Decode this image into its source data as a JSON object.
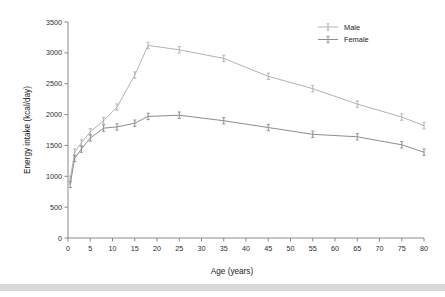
{
  "chart_data": {
    "type": "line",
    "title": "",
    "xlabel": "Age (years)",
    "ylabel": "Energy intake (kcal/day)",
    "xlim": [
      0,
      80
    ],
    "ylim": [
      0,
      3500
    ],
    "xticks": [
      0,
      5,
      10,
      15,
      20,
      25,
      30,
      35,
      40,
      45,
      50,
      55,
      60,
      65,
      70,
      75,
      80
    ],
    "yticks": [
      0,
      500,
      1000,
      1500,
      2000,
      2500,
      3000,
      3500
    ],
    "grid": false,
    "legend_position": "top-right",
    "x": [
      0.5,
      1.5,
      3,
      5,
      8,
      11,
      15,
      18,
      25,
      35,
      45,
      55,
      65,
      75,
      80
    ],
    "series": [
      {
        "name": "Male",
        "color": "#b3b3b3",
        "marker": "error-bar",
        "values": [
          950,
          1390,
          1540,
          1720,
          1900,
          2120,
          2640,
          3120,
          3050,
          2910,
          2620,
          2420,
          2170,
          1960,
          1820
        ]
      },
      {
        "name": "Female",
        "color": "#8d8d8d",
        "marker": "error-bar",
        "values": [
          870,
          1290,
          1440,
          1620,
          1780,
          1800,
          1860,
          1970,
          1990,
          1900,
          1790,
          1680,
          1640,
          1510,
          1390
        ]
      }
    ]
  },
  "legend": {
    "entries": [
      {
        "label": "Male"
      },
      {
        "label": "Female"
      }
    ]
  },
  "axes": {
    "x_title": "Age (years)",
    "y_title": "Energy intake (kcal/day)"
  }
}
